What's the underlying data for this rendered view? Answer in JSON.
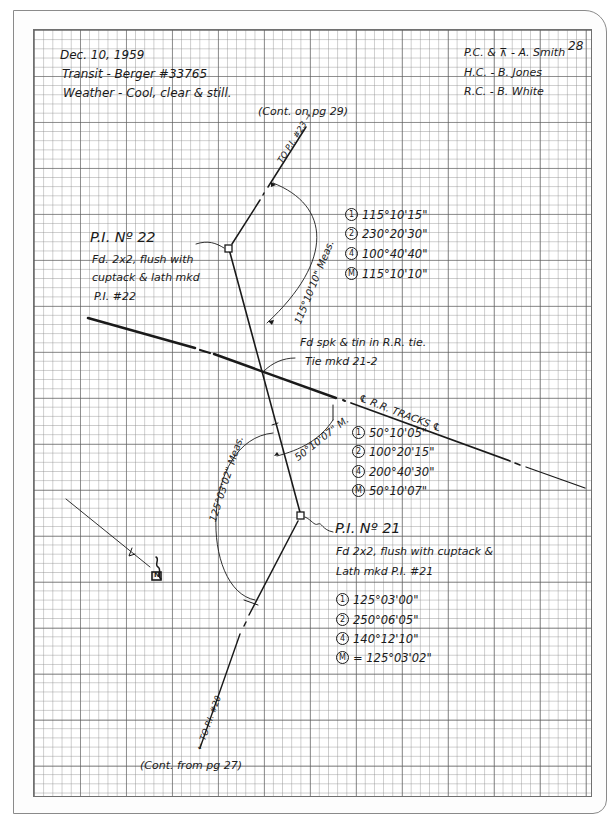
{
  "page": {
    "number": "28",
    "header_left": {
      "date": "Dec. 10, 1959",
      "instrument": "Transit - Berger #33765",
      "weather": "Weather - Cool, clear & still."
    },
    "header_right": {
      "crew_1": "P.C. & ⊼ - A. Smith",
      "crew_2": "H.C. - B. Jones",
      "crew_3": "R.C. - B. White"
    },
    "cont_on": "(Cont. on pg 29)",
    "cont_from": "(Cont. from pg 27)"
  },
  "pi22": {
    "title": "P.I. Nº 22",
    "desc_1": "Fd. 2x2, flush with",
    "desc_2": "cuptack & lath mkd",
    "desc_3": "P.I. #22",
    "to_label": "TO P.I. #23 →",
    "angle_label": "115°10'10\" Meas.",
    "observations": [
      {
        "mark": "1",
        "value": "115°10'15\""
      },
      {
        "mark": "2",
        "value": "230°20'30\""
      },
      {
        "mark": "4",
        "value": "100°40'40\""
      },
      {
        "mark": "M",
        "value": "115°10'10\""
      }
    ]
  },
  "tie": {
    "note_1": "Fd spk & tin in R.R. tie.",
    "note_2": "Tie mkd 21-2",
    "track_label": "℄ R.R. TRACKS ℄",
    "angle_label": "50°10'07\" M.",
    "observations": [
      {
        "mark": "1",
        "value": "50°10'05\""
      },
      {
        "mark": "2",
        "value": "100°20'15\""
      },
      {
        "mark": "4",
        "value": "200°40'30\""
      },
      {
        "mark": "M",
        "value": "50°10'07\""
      }
    ]
  },
  "pi21": {
    "title": "P.I. Nº 21",
    "desc_1": "Fd 2x2, flush with cuptack &",
    "desc_2": "Lath mkd P.I. #21",
    "to_label": "← TO P.I. #20",
    "angle_label": "125°03'02\" Meas.",
    "observations": [
      {
        "mark": "1",
        "value": "125°03'00\""
      },
      {
        "mark": "2",
        "value": "250°06'05\""
      },
      {
        "mark": "4",
        "value": "140°12'10\""
      },
      {
        "mark": "M",
        "value": "= 125°03'02\""
      }
    ]
  },
  "north_arrow": {
    "label": "N"
  }
}
